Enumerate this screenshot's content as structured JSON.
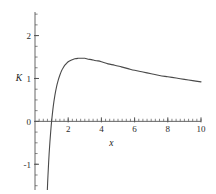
{
  "chart_data": {
    "type": "line",
    "title": "",
    "xlabel": "x",
    "ylabel": "K",
    "xlim": [
      0,
      10
    ],
    "ylim": [
      -1.6,
      2.55
    ],
    "grid": false,
    "legend": null,
    "axis_style": "centered-origin",
    "line_color": "#4a4a4a",
    "xticks": [
      2,
      4,
      6,
      8,
      10
    ],
    "xtick_labels": [
      "2",
      "4",
      "6",
      "8",
      "10"
    ],
    "x_minor_tick_step": 0.25,
    "yticks": [
      -1,
      0,
      1,
      2
    ],
    "ytick_labels": [
      "-1",
      "0",
      "1",
      "2"
    ],
    "y_minor_tick_step": 0.25,
    "annotations": {
      "peak_x": 2.72,
      "peak_y": 2.32,
      "zero_crossing_x": 1.0,
      "value_at_x10": 0.92
    },
    "series": [
      {
        "name": "K(x)",
        "x": [
          0.62,
          0.65,
          0.68,
          0.72,
          0.76,
          0.8,
          0.85,
          0.9,
          0.95,
          1.0,
          1.1,
          1.2,
          1.3,
          1.4,
          1.5,
          1.6,
          1.7,
          1.8,
          1.9,
          2.0,
          2.2,
          2.4,
          2.6,
          2.72,
          2.8,
          3.0,
          3.2,
          3.4,
          3.6,
          3.8,
          4.0,
          4.4,
          4.8,
          5.2,
          5.6,
          6.0,
          6.5,
          7.0,
          7.5,
          8.0,
          8.5,
          9.0,
          9.5,
          10.0
        ],
        "y": [
          -3.08,
          -2.65,
          -2.27,
          -1.83,
          -1.44,
          -1.12,
          -0.76,
          -0.47,
          -0.22,
          0.0,
          0.35,
          0.61,
          0.81,
          0.96,
          1.08,
          1.18,
          1.25,
          1.31,
          1.35,
          1.39,
          1.43,
          1.46,
          1.47,
          1.47,
          1.47,
          1.47,
          1.45,
          1.44,
          1.42,
          1.41,
          1.39,
          1.34,
          1.31,
          1.27,
          1.23,
          1.19,
          1.15,
          1.11,
          1.07,
          1.04,
          1.01,
          0.98,
          0.95,
          0.92
        ]
      }
    ]
  },
  "figure": {
    "background": "#ffffff",
    "axis_color": "#555555",
    "curve_color": "#4a4a4a"
  }
}
